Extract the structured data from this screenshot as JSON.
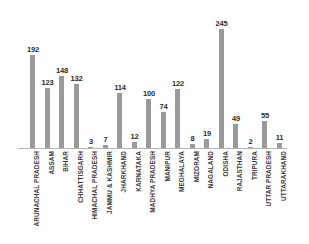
{
  "chart_data": {
    "type": "bar",
    "title": "",
    "subtitle": "",
    "xlabel": "",
    "ylabel": "",
    "grid": false,
    "legend": false,
    "axis_baseline_only": true,
    "bar_color": "#9a9a9a",
    "value_label_color": "#2b2b2b",
    "category_label_color": "#3a3a3a",
    "background_color": "#ffffff",
    "ylim": [
      0,
      245
    ],
    "categories": [
      "ARUNACHAL PRADESH",
      "ASSAM",
      "BIHAR",
      "CHHATTISGARH",
      "HIMACHAL PRADESH",
      "JAMMU & KASHMIR",
      "JHARKHAND",
      "KARNATAKA",
      "MADHYA PRADESH",
      "MANIPUR",
      "MEGHALAYA",
      "MIZORAM",
      "NAGALAND",
      "ODISHA",
      "RAJASTHAN",
      "TRIPURA",
      "UTTAR PRADESH",
      "UTTARAKHAND"
    ],
    "values": [
      192,
      123,
      148,
      132,
      3,
      7,
      114,
      12,
      100,
      74,
      122,
      8,
      19,
      245,
      49,
      2,
      55,
      11
    ],
    "value_labels": [
      "192",
      "123",
      "148",
      "132",
      "3",
      "7",
      "114",
      "12",
      "100",
      "74",
      "122",
      "8",
      "19",
      "245",
      "49",
      "2",
      "55",
      "11"
    ]
  }
}
